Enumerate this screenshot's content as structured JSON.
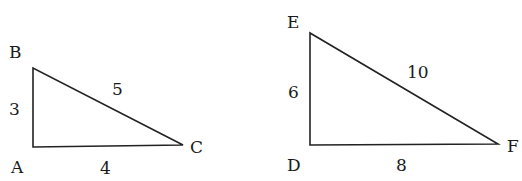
{
  "triangles": [
    {
      "name": "ABC",
      "vertices": {
        "A": "A",
        "B": "B",
        "C": "C"
      },
      "sides": {
        "AB": "3",
        "BC": "5",
        "AC": "4"
      }
    },
    {
      "name": "DEF",
      "vertices": {
        "D": "D",
        "E": "E",
        "F": "F"
      },
      "sides": {
        "DE": "6",
        "EF": "10",
        "DF": "8"
      }
    }
  ],
  "colors": {
    "stroke": "#222222",
    "text": "#1a1a1a",
    "background": "#ffffff"
  }
}
